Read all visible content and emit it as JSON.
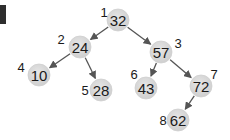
{
  "diagram": {
    "type": "binary-heap-tree",
    "colors": {
      "node_fill": "#d9d9d9",
      "node_stroke": "#cfcfcf",
      "edge": "#555555",
      "text": "#1a1a1a",
      "corner_block": "#2e2e2e"
    },
    "nodes": [
      {
        "index": "1",
        "value": "32",
        "cx": 118,
        "cy": 20,
        "lx": 104,
        "ly": 12
      },
      {
        "index": "2",
        "value": "24",
        "cx": 80,
        "cy": 47,
        "lx": 61,
        "ly": 39
      },
      {
        "index": "3",
        "value": "57",
        "cx": 161,
        "cy": 52,
        "lx": 178,
        "ly": 43
      },
      {
        "index": "4",
        "value": "10",
        "cx": 39,
        "cy": 75,
        "lx": 21,
        "ly": 67
      },
      {
        "index": "5",
        "value": "28",
        "cx": 101,
        "cy": 90,
        "lx": 85,
        "ly": 90
      },
      {
        "index": "6",
        "value": "43",
        "cx": 146,
        "cy": 88,
        "lx": 134,
        "ly": 74
      },
      {
        "index": "7",
        "value": "72",
        "cx": 201,
        "cy": 86,
        "lx": 214,
        "ly": 74
      },
      {
        "index": "8",
        "value": "62",
        "cx": 178,
        "cy": 120,
        "lx": 163,
        "ly": 120
      }
    ],
    "edges": [
      {
        "from": "32",
        "to": "24"
      },
      {
        "from": "32",
        "to": "57"
      },
      {
        "from": "24",
        "to": "10"
      },
      {
        "from": "24",
        "to": "28"
      },
      {
        "from": "57",
        "to": "43"
      },
      {
        "from": "57",
        "to": "72"
      },
      {
        "from": "72",
        "to": "62"
      }
    ]
  }
}
